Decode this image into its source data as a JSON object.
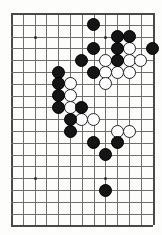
{
  "figure": {
    "kind": "go-board-diagram",
    "title": "",
    "caption": ""
  },
  "board": {
    "columns": 13,
    "rows": 19,
    "cell_size": 11.8,
    "origin_x": 11,
    "origin_y": 13,
    "line_color": "#6e6e6e",
    "edge_color": "#4a4a4a",
    "background_color": "#fdfdfc",
    "black_color": "#151515",
    "white_color": "#ffffff",
    "star_points": [
      {
        "col": 2,
        "row": 2
      },
      {
        "col": 8,
        "row": 2
      },
      {
        "col": 2,
        "row": 14
      },
      {
        "col": 8,
        "row": 14
      }
    ]
  },
  "chart_data": {
    "type": "scatter",
    "xlabel": "",
    "ylabel": "",
    "grid": true,
    "legend": [
      "Black stone",
      "White stone"
    ],
    "black_stones": [
      {
        "col": 7,
        "row": 1
      },
      {
        "col": 9,
        "row": 2
      },
      {
        "col": 10,
        "row": 2
      },
      {
        "col": 7,
        "row": 3
      },
      {
        "col": 9,
        "row": 3
      },
      {
        "col": 12,
        "row": 3
      },
      {
        "col": 6,
        "row": 4
      },
      {
        "col": 9,
        "row": 4
      },
      {
        "col": 7,
        "row": 5
      },
      {
        "col": 4,
        "row": 5
      },
      {
        "col": 4,
        "row": 6
      },
      {
        "col": 4,
        "row": 7
      },
      {
        "col": 4,
        "row": 8
      },
      {
        "col": 6,
        "row": 8
      },
      {
        "col": 5,
        "row": 9
      },
      {
        "col": 5,
        "row": 10
      },
      {
        "col": 7,
        "row": 11
      },
      {
        "col": 9,
        "row": 11
      },
      {
        "col": 8,
        "row": 12
      },
      {
        "col": 8,
        "row": 15
      }
    ],
    "white_stones": [
      {
        "col": 10,
        "row": 3
      },
      {
        "col": 8,
        "row": 4
      },
      {
        "col": 10,
        "row": 4
      },
      {
        "col": 11,
        "row": 4
      },
      {
        "col": 8,
        "row": 5
      },
      {
        "col": 9,
        "row": 5
      },
      {
        "col": 10,
        "row": 5
      },
      {
        "col": 5,
        "row": 6
      },
      {
        "col": 5,
        "row": 7
      },
      {
        "col": 5,
        "row": 8
      },
      {
        "col": 8,
        "row": 6
      },
      {
        "col": 6,
        "row": 9
      },
      {
        "col": 7,
        "row": 9
      },
      {
        "col": 9,
        "row": 10
      },
      {
        "col": 10,
        "row": 10
      }
    ],
    "counts": {
      "black": 20,
      "white": 15
    }
  }
}
